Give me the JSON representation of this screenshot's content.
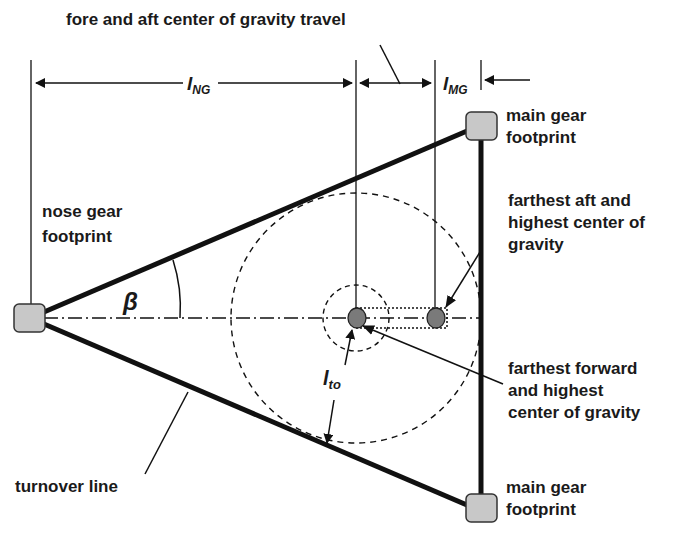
{
  "diagram": {
    "title_label": "fore and aft center of gravity travel",
    "labels": {
      "nose_gear_line1": "nose gear",
      "nose_gear_line2": "footprint",
      "main_gear_top_line1": "main gear",
      "main_gear_top_line2": "footprint",
      "main_gear_bottom_line1": "main gear",
      "main_gear_bottom_line2": "footprint",
      "aft_cg_line1": "farthest aft and",
      "aft_cg_line2": "highest center of",
      "aft_cg_line3": "gravity",
      "fwd_cg_line1": "farthest forward",
      "fwd_cg_line2": "and highest",
      "fwd_cg_line3": "center of gravity",
      "turnover_line": "turnover line"
    },
    "symbols": {
      "l_ng_main": "l",
      "l_ng_sub": "NG",
      "l_mg_main": "l",
      "l_mg_sub": "MG",
      "l_to_main": "l",
      "l_to_sub": "to",
      "beta": "β"
    },
    "colors": {
      "line": "#111111",
      "footprint_fill": "#c8c8c8",
      "cg_fill": "#7a7a7a"
    }
  }
}
